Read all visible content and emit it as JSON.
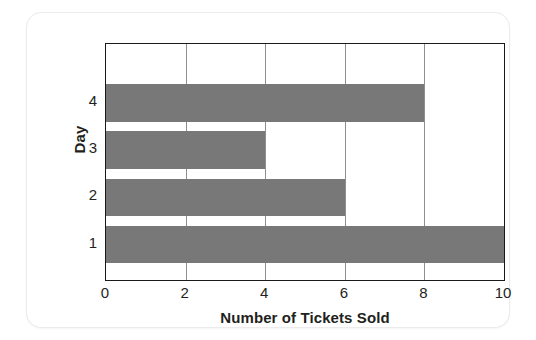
{
  "chart_data": {
    "type": "bar",
    "orientation": "horizontal",
    "title": "",
    "xlabel": "Number of Tickets Sold",
    "ylabel": "Day",
    "categories": [
      "1",
      "2",
      "3",
      "4"
    ],
    "values": [
      10,
      6,
      4,
      8
    ],
    "series": [
      {
        "name": "Tickets Sold",
        "values": [
          10,
          6,
          4,
          8
        ]
      }
    ],
    "xlim": [
      0,
      10
    ],
    "x_ticks": [
      "0",
      "2",
      "4",
      "6",
      "8",
      "10"
    ],
    "x_tick_values": [
      0,
      2,
      4,
      6,
      8,
      10
    ],
    "y_ticks": [
      "1",
      "2",
      "3",
      "4"
    ],
    "grid": "vertical",
    "legend": "none",
    "bar_color": "#787878",
    "grid_color": "#8e8e8e",
    "axis_color": "#1a1a1a"
  }
}
